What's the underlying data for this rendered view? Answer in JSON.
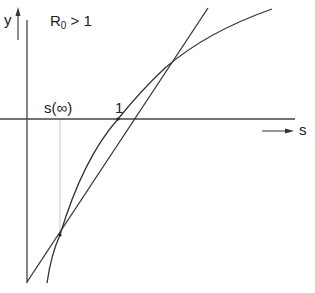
{
  "diagram": {
    "title_main": "R",
    "title_sub": "0",
    "title_rest": " > 1",
    "y_axis_label": "y",
    "s_axis_label": "s",
    "s_infinity_label": "s(∞)",
    "tick_one_label": "1",
    "colors": {
      "line": "#333333",
      "guide": "#bbbbbb",
      "background": "#ffffff"
    }
  }
}
